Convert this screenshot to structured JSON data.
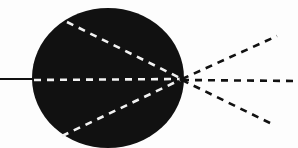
{
  "diagram": {
    "type": "ray-diagram",
    "description": "Black circular body with an incoming solid line from the left and dashed rays converging at a focal point on the right edge, then diverging outward.",
    "colors": {
      "background": "#fdfdfd",
      "body": "#111111",
      "ray_inside": "#f2f2f2",
      "ray_outside": "#111111",
      "incoming_line": "#111111"
    },
    "body": {
      "cx": 108,
      "cy": 78,
      "rx": 76,
      "ry": 70
    },
    "focal_point": {
      "x": 182,
      "y": 79
    },
    "incoming_line": {
      "x1": 0,
      "y1": 79,
      "x2": 34,
      "y2": 79
    },
    "inner_rays": [
      {
        "name": "upper",
        "x1": 67,
        "y1": 22,
        "x2": 182,
        "y2": 79
      },
      {
        "name": "middle",
        "x1": 34,
        "y1": 80,
        "x2": 182,
        "y2": 79
      },
      {
        "name": "lower",
        "x1": 62,
        "y1": 136,
        "x2": 182,
        "y2": 79
      }
    ],
    "outer_rays": [
      {
        "name": "upper-right",
        "x1": 182,
        "y1": 79,
        "x2": 277,
        "y2": 36
      },
      {
        "name": "middle-right",
        "x1": 182,
        "y1": 80,
        "x2": 298,
        "y2": 81
      },
      {
        "name": "lower-right",
        "x1": 182,
        "y1": 80,
        "x2": 272,
        "y2": 124
      }
    ]
  }
}
